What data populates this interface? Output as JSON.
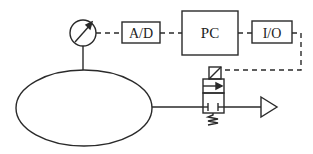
{
  "diagram": {
    "type": "pneumatic control loop",
    "colors": {
      "stroke": "#2a2a2a",
      "background": "#ffffff"
    },
    "nodes": [
      {
        "id": "gauge",
        "label": "",
        "icon": "pressure-gauge-icon"
      },
      {
        "id": "ad",
        "label": "A/D"
      },
      {
        "id": "pc",
        "label": "PC"
      },
      {
        "id": "io",
        "label": "I/O"
      },
      {
        "id": "tank",
        "label": "",
        "icon": "pressure-vessel"
      },
      {
        "id": "valve",
        "label": "",
        "icon": "solenoid-valve-icon"
      },
      {
        "id": "exhaust",
        "label": "",
        "icon": "exhaust-triangle-icon"
      }
    ],
    "edges": [
      {
        "from": "gauge",
        "to": "ad",
        "style": "dashed"
      },
      {
        "from": "ad",
        "to": "pc",
        "style": "dashed"
      },
      {
        "from": "pc",
        "to": "io",
        "style": "dashed"
      },
      {
        "from": "io",
        "to": "valve",
        "style": "dashed"
      },
      {
        "from": "tank",
        "to": "gauge",
        "style": "solid"
      },
      {
        "from": "tank",
        "to": "valve",
        "style": "solid"
      },
      {
        "from": "valve",
        "to": "exhaust",
        "style": "solid"
      }
    ]
  }
}
